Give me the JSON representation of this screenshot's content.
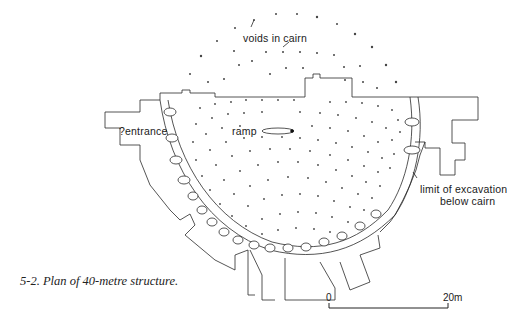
{
  "figure": {
    "caption": "5-2. Plan of 40-metre structure.",
    "colors": {
      "line": "#2a2a2a",
      "background": "#ffffff"
    }
  },
  "labels": {
    "voids": "voids in cairn",
    "ramp": "ramp",
    "entrance": "?entrance",
    "limit_line1": "limit of excavation",
    "limit_line2": "below cairn"
  },
  "scale_bar": {
    "start_label": "0",
    "end_label": "20m"
  }
}
